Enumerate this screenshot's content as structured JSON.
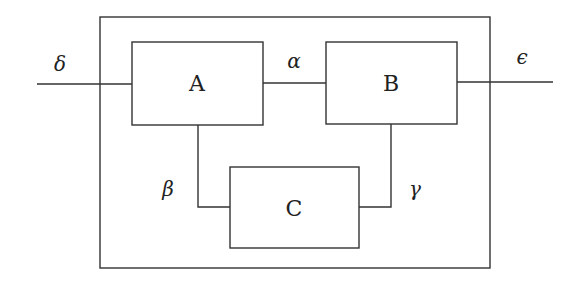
{
  "diagram": {
    "type": "block-diagram",
    "outer_box": {
      "x": 100,
      "y": 17,
      "width": 390,
      "height": 251
    },
    "blocks": [
      {
        "id": "A",
        "label": "A",
        "x": 132,
        "y": 42,
        "width": 131,
        "height": 83
      },
      {
        "id": "B",
        "label": "B",
        "x": 326,
        "y": 42,
        "width": 131,
        "height": 82
      },
      {
        "id": "C",
        "label": "C",
        "x": 230,
        "y": 167,
        "width": 129,
        "height": 81
      }
    ],
    "signals": {
      "input": "δ",
      "a_to_b": "α",
      "a_to_c": "β",
      "c_to_b": "γ",
      "output": "ϵ"
    },
    "edges": [
      {
        "from": "input",
        "to": "A",
        "label": "δ"
      },
      {
        "from": "A",
        "to": "B",
        "label": "α"
      },
      {
        "from": "A",
        "to": "C",
        "label": "β"
      },
      {
        "from": "C",
        "to": "B",
        "label": "γ"
      },
      {
        "from": "B",
        "to": "output",
        "label": "ϵ"
      }
    ]
  }
}
